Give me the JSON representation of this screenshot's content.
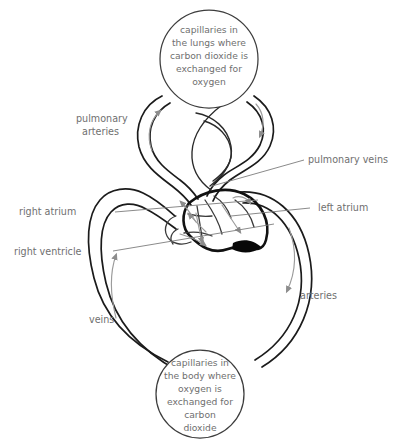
{
  "diagram": {
    "colors": {
      "vessel_stroke": "#1b1b1b",
      "heart_stroke": "#111111",
      "text": "#6f6f6f",
      "flow_arrow": "#9b9b9b",
      "leader_line": "#7d7d7d",
      "background": "#ffffff"
    },
    "lung_capillaries": {
      "lines": [
        "capillaries in",
        "the lungs where",
        "carbon dioxide is",
        "exchanged for",
        "oxygen"
      ]
    },
    "body_capillaries": {
      "lines": [
        "capillaries in",
        "the body where",
        "oxygen is",
        "exchanged for",
        "carbon",
        "dioxide"
      ]
    },
    "labels": {
      "pulmonary_arteries_line1": "pulmonary",
      "pulmonary_arteries_line2": "arteries",
      "pulmonary_veins": "pulmonary veins",
      "right_atrium": "right atrium",
      "left_atrium": "left atrium",
      "right_ventricle": "right ventricle",
      "veins": "veins",
      "arteries": "arteries"
    }
  }
}
